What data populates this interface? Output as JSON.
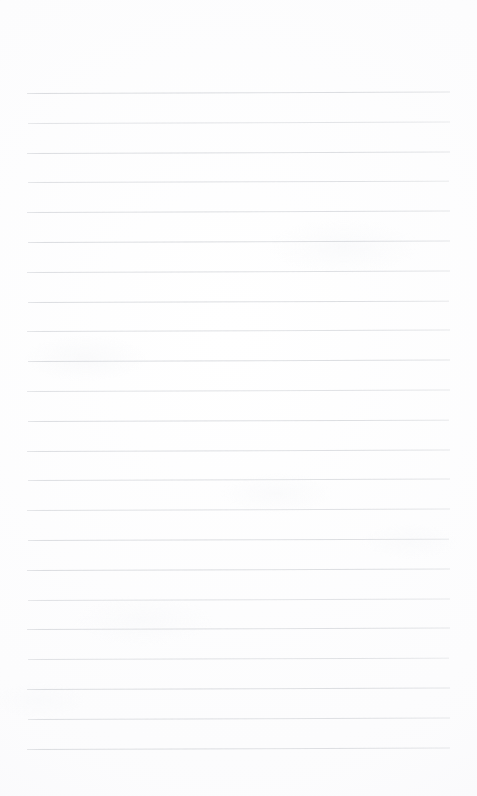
{
  "document": {
    "kind": "scanned-ruled-notebook-page",
    "title": "Blank Ruled Notebook Page",
    "page_width": 477,
    "page_height": 796,
    "content_text": "",
    "is_blank": true
  },
  "colors": {
    "paper_background": "#ffffff",
    "rule_line": "#d6d8dc",
    "rule_line_faint": "#e3e5e8",
    "scan_tint": "#f7f7fa"
  },
  "ruling": {
    "type": "wide-ruled",
    "line_count": 23,
    "line_spacing_px": 29.8,
    "first_line_y": 93,
    "last_line_y": 748,
    "line_start_x": 27,
    "line_end_x": 450,
    "line_thickness_px": 1,
    "top_margin_px": 93,
    "bottom_margin_px": 48,
    "left_margin_px": 27,
    "right_margin_px": 27,
    "has_vertical_margin_rule": false,
    "lines": [
      {
        "index": 1,
        "y": 93.0,
        "x1": 27,
        "x2": 450,
        "opacity": 0.92,
        "slope_px": -1.6
      },
      {
        "index": 2,
        "y": 122.8,
        "x1": 28,
        "x2": 450,
        "opacity": 0.72,
        "slope_px": -1.4
      },
      {
        "index": 3,
        "y": 152.6,
        "x1": 27,
        "x2": 450,
        "opacity": 0.88,
        "slope_px": -1.5
      },
      {
        "index": 4,
        "y": 182.4,
        "x1": 28,
        "x2": 449,
        "opacity": 0.8,
        "slope_px": -1.3
      },
      {
        "index": 5,
        "y": 212.2,
        "x1": 27,
        "x2": 450,
        "opacity": 0.86,
        "slope_px": -1.5
      },
      {
        "index": 6,
        "y": 242.0,
        "x1": 28,
        "x2": 450,
        "opacity": 0.9,
        "slope_px": -1.4
      },
      {
        "index": 7,
        "y": 271.8,
        "x1": 27,
        "x2": 450,
        "opacity": 0.84,
        "slope_px": -1.6
      },
      {
        "index": 8,
        "y": 301.6,
        "x1": 28,
        "x2": 449,
        "opacity": 0.88,
        "slope_px": -1.3
      },
      {
        "index": 9,
        "y": 331.4,
        "x1": 27,
        "x2": 450,
        "opacity": 0.82,
        "slope_px": -1.5
      },
      {
        "index": 10,
        "y": 361.2,
        "x1": 28,
        "x2": 450,
        "opacity": 0.9,
        "slope_px": -1.4
      },
      {
        "index": 11,
        "y": 391.0,
        "x1": 27,
        "x2": 450,
        "opacity": 0.78,
        "slope_px": -1.5
      },
      {
        "index": 12,
        "y": 420.8,
        "x1": 28,
        "x2": 449,
        "opacity": 0.88,
        "slope_px": -1.3
      },
      {
        "index": 13,
        "y": 450.6,
        "x1": 27,
        "x2": 450,
        "opacity": 0.86,
        "slope_px": -1.6
      },
      {
        "index": 14,
        "y": 480.4,
        "x1": 28,
        "x2": 450,
        "opacity": 0.84,
        "slope_px": -1.4
      },
      {
        "index": 15,
        "y": 510.2,
        "x1": 27,
        "x2": 450,
        "opacity": 0.8,
        "slope_px": -1.5
      },
      {
        "index": 16,
        "y": 540.0,
        "x1": 28,
        "x2": 449,
        "opacity": 0.88,
        "slope_px": -1.3
      },
      {
        "index": 17,
        "y": 569.8,
        "x1": 27,
        "x2": 450,
        "opacity": 0.9,
        "slope_px": -1.5
      },
      {
        "index": 18,
        "y": 599.6,
        "x1": 28,
        "x2": 450,
        "opacity": 0.76,
        "slope_px": -1.4
      },
      {
        "index": 19,
        "y": 629.4,
        "x1": 27,
        "x2": 450,
        "opacity": 0.86,
        "slope_px": -1.6
      },
      {
        "index": 20,
        "y": 659.2,
        "x1": 28,
        "x2": 449,
        "opacity": 0.78,
        "slope_px": -1.3
      },
      {
        "index": 21,
        "y": 689.0,
        "x1": 27,
        "x2": 450,
        "opacity": 0.9,
        "slope_px": -1.5
      },
      {
        "index": 22,
        "y": 718.8,
        "x1": 28,
        "x2": 450,
        "opacity": 0.84,
        "slope_px": -1.4
      },
      {
        "index": 23,
        "y": 748.6,
        "x1": 27,
        "x2": 450,
        "opacity": 0.88,
        "slope_px": -1.5
      }
    ]
  }
}
